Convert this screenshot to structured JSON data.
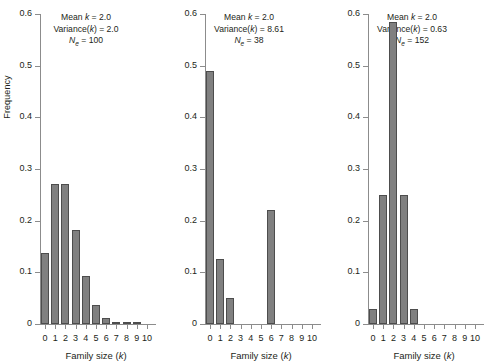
{
  "figure": {
    "ylabel": "Frequency",
    "xlabel_prefix": "Family size (",
    "xlabel_var": "k",
    "xlabel_suffix": ")"
  },
  "chart_data": [
    {
      "type": "bar",
      "title": "",
      "xlabel": "Family size (k)",
      "ylabel": "Frequency",
      "categories": [
        "0",
        "1",
        "2",
        "3",
        "4",
        "5",
        "6",
        "7",
        "8",
        "9",
        "10"
      ],
      "x": [
        0,
        1,
        2,
        3,
        4,
        5,
        6,
        7,
        8,
        9,
        10
      ],
      "values": [
        0.138,
        0.271,
        0.271,
        0.182,
        0.092,
        0.036,
        0.012,
        0.004,
        0.002,
        0.001,
        0.0
      ],
      "ylim": [
        0,
        0.6
      ],
      "yticks": [
        0,
        0.1,
        0.2,
        0.3,
        0.4,
        0.5,
        0.6
      ],
      "ytick_labels": [
        "0",
        "0.1",
        "0.2",
        "0.3",
        "0.4",
        "0.5",
        "0.6"
      ],
      "grid": false,
      "legend": "none",
      "annotation": {
        "mean_label": "Mean ",
        "mean_var": "k",
        "mean_eq": " = ",
        "mean_value": "2.0",
        "variance_label": "Variance(",
        "variance_var": "k",
        "variance_close": ") = ",
        "variance_value": "2.0",
        "ne_var": "N",
        "ne_sub": "e",
        "ne_eq": " = ",
        "ne_value": "100"
      }
    },
    {
      "type": "bar",
      "title": "",
      "xlabel": "Family size (k)",
      "ylabel": "",
      "categories": [
        "0",
        "1",
        "2",
        "3",
        "4",
        "5",
        "6",
        "7",
        "8",
        "9",
        "10"
      ],
      "x": [
        0,
        1,
        2,
        3,
        4,
        5,
        6,
        7,
        8,
        9,
        10
      ],
      "values": [
        0.49,
        0.125,
        0.05,
        0.0,
        0.0,
        0.0,
        0.22,
        0.0,
        0.0,
        0.0,
        0.0
      ],
      "ylim": [
        0,
        0.6
      ],
      "yticks": [
        0,
        0.1,
        0.2,
        0.3,
        0.4,
        0.5,
        0.6
      ],
      "ytick_labels": [
        "0",
        "0.1",
        "0.2",
        "0.3",
        "0.4",
        "0.5",
        "0.6"
      ],
      "grid": false,
      "legend": "none",
      "annotation": {
        "mean_label": "Mean ",
        "mean_var": "k",
        "mean_eq": " = ",
        "mean_value": "2.0",
        "variance_label": "Variance(",
        "variance_var": "k",
        "variance_close": ") = ",
        "variance_value": "8.61",
        "ne_var": "N",
        "ne_sub": "e",
        "ne_eq": " = ",
        "ne_value": "38"
      }
    },
    {
      "type": "bar",
      "title": "",
      "xlabel": "Family size (k)",
      "ylabel": "",
      "categories": [
        "0",
        "1",
        "2",
        "3",
        "4",
        "5",
        "6",
        "7",
        "8",
        "9",
        "10"
      ],
      "x": [
        0,
        1,
        2,
        3,
        4,
        5,
        6,
        7,
        8,
        9,
        10
      ],
      "values": [
        0.03,
        0.25,
        0.585,
        0.25,
        0.03,
        0.0,
        0.0,
        0.0,
        0.0,
        0.0,
        0.0
      ],
      "ylim": [
        0,
        0.6
      ],
      "yticks": [
        0,
        0.1,
        0.2,
        0.3,
        0.4,
        0.5,
        0.6
      ],
      "ytick_labels": [
        "0",
        "0.1",
        "0.2",
        "0.3",
        "0.4",
        "0.5",
        "0.6"
      ],
      "grid": false,
      "legend": "none",
      "annotation": {
        "mean_label": "Mean ",
        "mean_var": "k",
        "mean_eq": " = ",
        "mean_value": "2.0",
        "variance_label": "Variance(",
        "variance_var": "k",
        "variance_close": ") = ",
        "variance_value": "0.63",
        "ne_var": "N",
        "ne_sub": "e",
        "ne_eq": " = ",
        "ne_value": "152"
      }
    }
  ],
  "style": {
    "bar_fill": "#808080",
    "bar_border": "#4d4d4d",
    "axis_color": "#8c8c8c",
    "text_color": "#231f20"
  }
}
